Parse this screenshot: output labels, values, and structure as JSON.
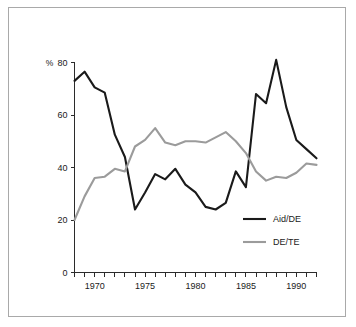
{
  "figure": {
    "frame_color": "#a9a9a9",
    "background": "#ffffff"
  },
  "chart_data": {
    "type": "line",
    "title": "",
    "subtitle": "",
    "xlabel": "",
    "ylabel": "",
    "y_unit_label": "%",
    "xlim": [
      1968,
      1992
    ],
    "ylim": [
      0,
      80
    ],
    "grid": false,
    "legend_position": "inside-lower-right",
    "x": [
      1968,
      1969,
      1970,
      1971,
      1972,
      1973,
      1974,
      1975,
      1976,
      1977,
      1978,
      1979,
      1980,
      1981,
      1982,
      1983,
      1984,
      1985,
      1986,
      1987,
      1988,
      1989,
      1990,
      1991,
      1992
    ],
    "xticks": [
      1970,
      1975,
      1980,
      1985,
      1990
    ],
    "xticklabels": [
      "1970",
      "1975",
      "1980",
      "1985",
      "1990"
    ],
    "x_minor_ticks": [
      1968,
      1969,
      1970,
      1971,
      1972,
      1973,
      1974,
      1975,
      1976,
      1977,
      1978,
      1979,
      1980,
      1981,
      1982,
      1983,
      1984,
      1985,
      1986,
      1987,
      1988,
      1989,
      1990,
      1991,
      1992
    ],
    "yticks": [
      0,
      20,
      40,
      60,
      80
    ],
    "yticklabels": [
      "0",
      "20",
      "40",
      "60",
      "80"
    ],
    "series": [
      {
        "name": "Aid/DE",
        "color": "#1a1a1a",
        "width": 2.1,
        "values": [
          73.0,
          76.5,
          70.5,
          68.5,
          52.5,
          44.0,
          24.0,
          30.5,
          37.5,
          35.5,
          39.5,
          33.5,
          30.5,
          25.0,
          24.0,
          26.5,
          38.5,
          32.5,
          68.0,
          64.5,
          81.0,
          63.0,
          50.5,
          47.0,
          43.5
        ]
      },
      {
        "name": "DE/TE",
        "color": "#9b9b9b",
        "width": 2.1,
        "values": [
          20.0,
          29.0,
          36.0,
          36.5,
          39.5,
          38.5,
          48.0,
          50.5,
          55.0,
          49.5,
          48.5,
          50.0,
          50.0,
          49.5,
          51.5,
          53.5,
          50.0,
          45.5,
          38.5,
          35.0,
          36.5,
          36.0,
          38.0,
          41.5,
          41.0
        ]
      }
    ]
  },
  "legend": {
    "entries": [
      {
        "label": "Aid/DE",
        "color": "#1a1a1a"
      },
      {
        "label": "DE/TE",
        "color": "#9b9b9b"
      }
    ]
  }
}
